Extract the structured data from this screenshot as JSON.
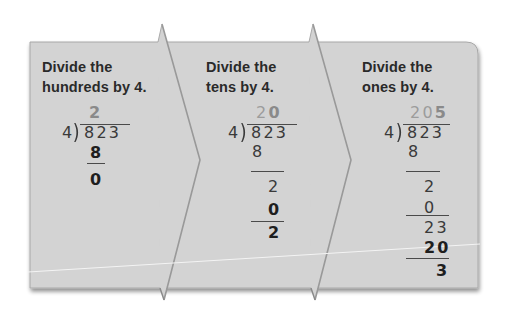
{
  "colors": {
    "panel_bg": "#d3d3d3",
    "divider": "#9a9a9a",
    "text": "#2a2a2a",
    "quotient_light": "#9c9c9c"
  },
  "steps": [
    {
      "title_line1": "Divide the",
      "title_line2": "hundreds by 4.",
      "quotient_light": "",
      "quotient_bold": "2",
      "divisor": "4",
      "dividend": "823",
      "work": [
        {
          "text": "8",
          "bold": true
        },
        {
          "text": "0",
          "bold": true
        }
      ]
    },
    {
      "title_line1": "Divide the",
      "title_line2": "tens by 4.",
      "quotient_light": "2",
      "quotient_bold": "0",
      "divisor": "4",
      "dividend": "823",
      "work": [
        {
          "text": "8",
          "bold": false
        },
        {
          "text": "2",
          "bold": false
        },
        {
          "text": "0",
          "bold": true
        },
        {
          "text": "2",
          "bold": true
        }
      ]
    },
    {
      "title_line1": "Divide the",
      "title_line2": "ones by 4.",
      "quotient_light": "20",
      "quotient_bold": "5",
      "divisor": "4",
      "dividend": "823",
      "work": [
        {
          "text": "8",
          "bold": false
        },
        {
          "text": "2",
          "bold": false
        },
        {
          "text": "0",
          "bold": false
        },
        {
          "text": "23",
          "bold": false
        },
        {
          "text": "20",
          "bold": true
        },
        {
          "text": "3",
          "bold": true
        }
      ]
    }
  ]
}
